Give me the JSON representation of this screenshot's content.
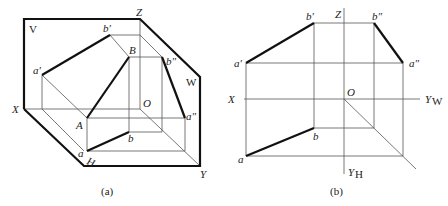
{
  "figure_a": {
    "caption": "(a)",
    "planes": {
      "V": "V",
      "W": "W",
      "H": "H"
    },
    "axes": {
      "X": "X",
      "Y": "Y",
      "Z": "Z",
      "O": "O"
    },
    "points": {
      "a_prime": "a′",
      "b_prime": "b′",
      "B": "B",
      "b_dprime": "b″",
      "A": "A",
      "a": "a",
      "b": "b",
      "a_dprime": "a″"
    }
  },
  "figure_b": {
    "caption": "(b)",
    "axes": {
      "X": "X",
      "Z": "Z",
      "O": "O",
      "Yw": "Y",
      "Yw_sub": "W",
      "Yh": "Y",
      "Yh_sub": "H"
    },
    "points": {
      "a_prime": "a′",
      "b_prime": "b′",
      "b_dprime": "b″",
      "a_dprime": "a″",
      "a": "a",
      "b": "b"
    }
  }
}
